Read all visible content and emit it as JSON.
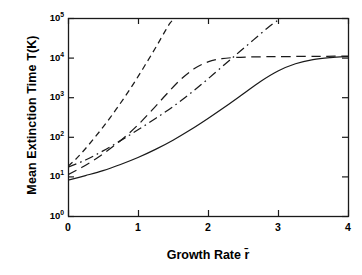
{
  "chart_data": {
    "type": "line",
    "title": "",
    "xlabel": "Growth Rate r̄",
    "ylabel": "Mean Extinction Time T(K)",
    "xlim": [
      0,
      4
    ],
    "ylim": [
      1,
      100000
    ],
    "yscale": "log",
    "grid": false,
    "legend": null,
    "xticks": [
      "0",
      "1",
      "2",
      "3",
      "4"
    ],
    "xtick_values": [
      0,
      1,
      2,
      3,
      4
    ],
    "ytick_labels": [
      "10",
      "10",
      "10",
      "10",
      "10",
      "10"
    ],
    "ytick_exponents": [
      "0",
      "1",
      "2",
      "3",
      "4",
      "5"
    ],
    "ytick_values": [
      1,
      10,
      100,
      1000,
      10000,
      100000
    ],
    "series": [
      {
        "name": "steep-dashed",
        "style": "dashed",
        "color": "#1a1a1a",
        "points": [
          [
            0.0,
            18
          ],
          [
            0.1,
            26
          ],
          [
            0.2,
            40
          ],
          [
            0.3,
            64
          ],
          [
            0.4,
            105
          ],
          [
            0.5,
            175
          ],
          [
            0.6,
            300
          ],
          [
            0.7,
            530
          ],
          [
            0.8,
            950
          ],
          [
            0.9,
            1750
          ],
          [
            1.0,
            3300
          ],
          [
            1.1,
            6400
          ],
          [
            1.2,
            12500
          ],
          [
            1.3,
            25000
          ],
          [
            1.4,
            51000
          ],
          [
            1.46,
            75000
          ],
          [
            1.52,
            100000
          ]
        ]
      },
      {
        "name": "plateau-long-dashed",
        "style": "long-dashed",
        "color": "#1a1a1a",
        "points": [
          [
            0.0,
            11
          ],
          [
            0.2,
            17
          ],
          [
            0.4,
            28
          ],
          [
            0.6,
            50
          ],
          [
            0.8,
            95
          ],
          [
            1.0,
            200
          ],
          [
            1.2,
            470
          ],
          [
            1.4,
            1150
          ],
          [
            1.6,
            2700
          ],
          [
            1.8,
            5200
          ],
          [
            2.0,
            7800
          ],
          [
            2.2,
            9400
          ],
          [
            2.4,
            10100
          ],
          [
            2.6,
            10400
          ],
          [
            2.8,
            10500
          ],
          [
            3.0,
            10600
          ],
          [
            3.4,
            10700
          ],
          [
            3.7,
            10800
          ],
          [
            4.0,
            10900
          ]
        ]
      },
      {
        "name": "dash-dot",
        "style": "dash-dot",
        "color": "#1a1a1a",
        "points": [
          [
            0.0,
            17
          ],
          [
            0.25,
            26
          ],
          [
            0.5,
            44
          ],
          [
            0.75,
            80
          ],
          [
            1.0,
            150
          ],
          [
            1.25,
            290
          ],
          [
            1.5,
            580
          ],
          [
            1.75,
            1250
          ],
          [
            2.0,
            2900
          ],
          [
            2.25,
            7000
          ],
          [
            2.45,
            14000
          ],
          [
            2.65,
            28000
          ],
          [
            2.85,
            56000
          ],
          [
            3.0,
            88000
          ],
          [
            3.05,
            100000
          ]
        ]
      },
      {
        "name": "solid-saturating",
        "style": "solid",
        "color": "#1a1a1a",
        "points": [
          [
            0.0,
            8
          ],
          [
            0.25,
            10.5
          ],
          [
            0.5,
            14
          ],
          [
            0.75,
            20
          ],
          [
            1.0,
            30
          ],
          [
            1.25,
            48
          ],
          [
            1.5,
            82
          ],
          [
            1.75,
            150
          ],
          [
            2.0,
            290
          ],
          [
            2.25,
            580
          ],
          [
            2.5,
            1200
          ],
          [
            2.75,
            2500
          ],
          [
            3.0,
            4600
          ],
          [
            3.25,
            7000
          ],
          [
            3.5,
            8900
          ],
          [
            3.75,
            10000
          ],
          [
            4.0,
            10600
          ]
        ]
      }
    ]
  },
  "axes": {
    "plot_left_px": 68,
    "plot_right_px": 348,
    "plot_top_px": 18,
    "plot_bottom_px": 216
  }
}
